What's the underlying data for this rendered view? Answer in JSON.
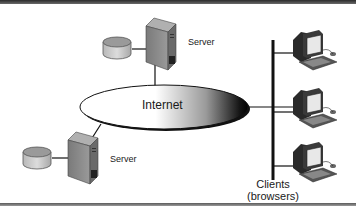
{
  "diagram": {
    "title": "",
    "colors": {
      "frame": "#3a3a3a",
      "line": "#111111",
      "server_body": "#8c8c8c",
      "disk": "#c8c8c8",
      "ellipse_dark": "#111111",
      "ellipse_light": "#ffffff"
    },
    "nodes": {
      "internet": {
        "label": "Internet"
      },
      "server_top": {
        "label": "Server"
      },
      "server_bottom": {
        "label": "Server"
      },
      "clients": {
        "label_line1": "Clients",
        "label_line2": "(browsers)",
        "count": 3
      }
    },
    "edges": [
      {
        "from": "server_top",
        "to": "internet"
      },
      {
        "from": "server_bottom",
        "to": "internet"
      },
      {
        "from": "internet",
        "to": "clients_bus"
      },
      {
        "from": "clients_bus",
        "to": "client_1"
      },
      {
        "from": "clients_bus",
        "to": "client_2"
      },
      {
        "from": "clients_bus",
        "to": "client_3"
      },
      {
        "from": "disk_top",
        "to": "server_top"
      },
      {
        "from": "disk_bottom",
        "to": "server_bottom"
      }
    ]
  }
}
